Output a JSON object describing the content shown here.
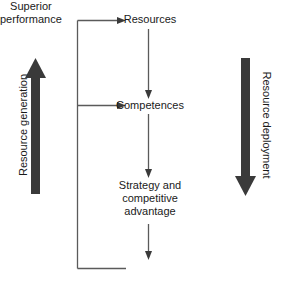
{
  "diagram": {
    "colors": {
      "arrow_fill": "#3a3a3a",
      "connector_stroke": "#5a5a5a",
      "text": "#1a1a1a",
      "background": "#ffffff"
    },
    "side_arrows": [
      {
        "id": "resource-generation",
        "label": "Resource generation",
        "direction": "up",
        "position": "left"
      },
      {
        "id": "resource-deployment",
        "label": "Resource deployment",
        "direction": "down",
        "position": "right"
      }
    ],
    "nodes": [
      {
        "id": "resources",
        "label": "Resources"
      },
      {
        "id": "competences",
        "label": "Competences"
      },
      {
        "id": "strategy",
        "label": "Strategy and\ncompetitive\nadvantage"
      },
      {
        "id": "superior-performance",
        "label": "Superior\nperformance"
      }
    ],
    "connectors": [
      {
        "from": "resources",
        "to": "competences",
        "type": "arrow-down"
      },
      {
        "from": "competences",
        "to": "strategy",
        "type": "arrow-down"
      },
      {
        "from": "strategy",
        "to": "superior-performance",
        "type": "arrow-down"
      },
      {
        "from": "superior-performance",
        "to": "resources",
        "type": "feedback-arrow"
      },
      {
        "from": "superior-performance",
        "to": "competences",
        "type": "feedback-arrow"
      }
    ]
  }
}
